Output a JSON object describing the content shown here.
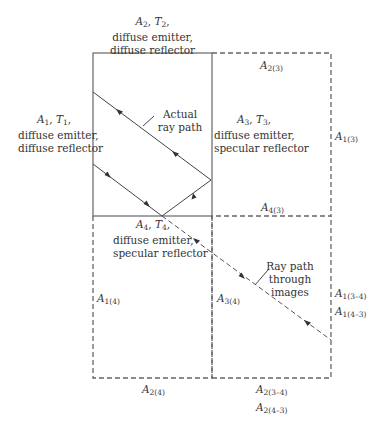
{
  "diagram": {
    "surfaces": {
      "A1": {
        "symbol": "A",
        "sub": "1",
        "temp_symbol": "T",
        "temp_sub": "1",
        "line1": "diffuse emitter,",
        "line2": "diffuse reflector"
      },
      "A2": {
        "symbol": "A",
        "sub": "2",
        "temp_symbol": "T",
        "temp_sub": "2",
        "line1": "diffuse emitter,",
        "line2": "diffuse reflector"
      },
      "A3": {
        "symbol": "A",
        "sub": "3",
        "temp_symbol": "T",
        "temp_sub": "3",
        "line1": "diffuse emitter,",
        "line2": "specular reflector"
      },
      "A4": {
        "symbol": "A",
        "sub": "4",
        "temp_symbol": "T",
        "temp_sub": "4",
        "line1": "diffuse emitter,",
        "line2": "specular reflector"
      }
    },
    "image_labels": {
      "A2_3": {
        "symbol": "A",
        "sub": "2(3)"
      },
      "A1_3": {
        "symbol": "A",
        "sub": "1(3)"
      },
      "A4_3": {
        "symbol": "A",
        "sub": "4(3)"
      },
      "A1_4": {
        "symbol": "A",
        "sub": "1(4)"
      },
      "A3_4": {
        "symbol": "A",
        "sub": "3(4)"
      },
      "A1_34": {
        "symbol": "A",
        "sub": "1(3–4)"
      },
      "A1_43": {
        "symbol": "A",
        "sub": "1(4–3)"
      },
      "A2_4": {
        "symbol": "A",
        "sub": "2(4)"
      },
      "A2_34": {
        "symbol": "A",
        "sub": "2(3–4)"
      },
      "A2_43": {
        "symbol": "A",
        "sub": "2(4–3)"
      }
    },
    "annotations": {
      "actual_line1": "Actual",
      "actual_line2": "ray path",
      "images_line1": "Ray path",
      "images_line2": "through",
      "images_line3": "images"
    },
    "colors": {
      "line": "#555555",
      "text": "#333333"
    }
  }
}
